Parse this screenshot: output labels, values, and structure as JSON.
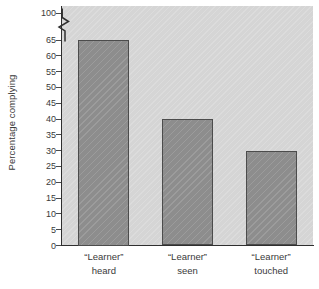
{
  "chart_data": {
    "type": "bar",
    "title": "",
    "xlabel": "",
    "ylabel": "Percentage complying",
    "categories": [
      "“Learner” heard",
      "“Learner” seen",
      "“Learner” touched"
    ],
    "category_lines": [
      [
        "“Learner”",
        "heard"
      ],
      [
        "“Learner”",
        "seen"
      ],
      [
        "“Learner”",
        "touched"
      ]
    ],
    "values": [
      65,
      40,
      30
    ],
    "ylim": [
      0,
      100
    ],
    "y_axis_break": {
      "from": 65,
      "to": 100,
      "style": "zigzag"
    },
    "ytick_labels": [
      "0",
      "5",
      "10",
      "15",
      "20",
      "25",
      "30",
      "35",
      "40",
      "45",
      "50",
      "55",
      "60",
      "65",
      "100"
    ],
    "yticks": [
      0,
      5,
      10,
      15,
      20,
      25,
      30,
      35,
      40,
      45,
      50,
      55,
      60,
      65,
      100
    ],
    "grid": false,
    "legend": "none",
    "colors": {
      "plot_background": "#d5d5d5",
      "bar_fill": "#8d8d8d",
      "bar_edge": "#4c4c4c",
      "axis": "#2f2f2f",
      "text": "#3a3a3a",
      "figure_background": "#ffffff"
    }
  }
}
